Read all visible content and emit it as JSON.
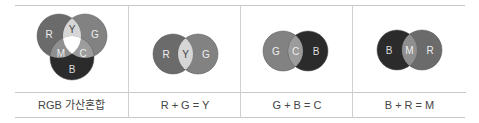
{
  "panels": [
    {
      "caption": "RGB 가산혼합",
      "labels": {
        "r": "R",
        "g": "G",
        "b": "B",
        "y": "Y",
        "m": "M",
        "c": "C"
      }
    },
    {
      "caption": "R + G = Y",
      "labels": {
        "left": "R",
        "mid": "Y",
        "right": "G"
      }
    },
    {
      "caption": "G + B = C",
      "labels": {
        "left": "G",
        "mid": "C",
        "right": "B"
      }
    },
    {
      "caption": "B + R = M",
      "labels": {
        "left": "B",
        "mid": "M",
        "right": "R"
      }
    }
  ],
  "colors": {
    "R": "#6b6b6b",
    "G": "#828282",
    "B": "#2b2b2b",
    "Y": "#d6d6d6",
    "C": "#9c9c9c",
    "M": "#8f8f8f",
    "W": "#ffffff"
  }
}
